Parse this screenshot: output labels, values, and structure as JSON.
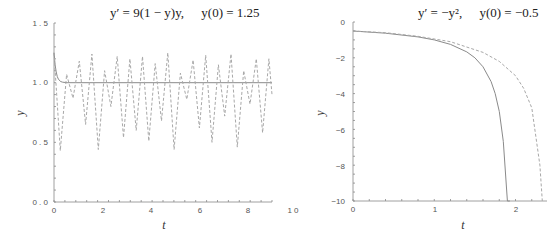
{
  "chart_data": [
    {
      "type": "line",
      "title": "y' = 9(1 − y)y,    y(0) = 1.25",
      "xlabel": "t",
      "ylabel": "y",
      "xlim": [
        0,
        10
      ],
      "ylim": [
        0,
        1.5
      ],
      "xticks": [
        "0",
        "2",
        "4",
        "6",
        "8",
        "10"
      ],
      "yticks": [
        "0.0",
        "0.5",
        "1.0",
        "1.5"
      ],
      "grid": false,
      "series": [
        {
          "name": "exact solution",
          "style": "solid",
          "x": [
            0,
            0.05,
            0.1,
            0.15,
            0.2,
            0.3,
            0.4,
            0.6,
            10
          ],
          "y": [
            1.25,
            1.15,
            1.09,
            1.05,
            1.03,
            1.01,
            1.004,
            1.0,
            1.0
          ]
        },
        {
          "name": "numerical (large step)",
          "style": "dashed",
          "x": [
            0,
            0.29,
            0.58,
            0.87,
            1.16,
            1.45,
            1.74,
            2.03,
            2.32,
            2.61,
            2.9,
            3.19,
            3.48,
            3.77,
            4.06,
            4.35,
            4.64,
            4.93,
            5.22,
            5.51,
            5.8,
            6.09,
            6.38,
            6.67,
            6.96,
            7.25,
            7.54,
            7.83,
            8.12,
            8.41,
            8.7,
            8.99,
            9.28,
            9.57,
            9.86,
            10
          ],
          "y": [
            1.25,
            0.43,
            1.07,
            0.87,
            1.18,
            0.65,
            1.24,
            0.44,
            1.1,
            0.8,
            1.22,
            0.54,
            1.2,
            0.6,
            1.22,
            0.51,
            1.16,
            0.68,
            1.25,
            0.44,
            1.08,
            0.86,
            1.19,
            0.62,
            1.23,
            0.5,
            1.15,
            0.72,
            1.24,
            0.46,
            1.1,
            0.82,
            1.2,
            0.58,
            1.2,
            0.9
          ]
        }
      ]
    },
    {
      "type": "line",
      "title": "y' = −y²,    y(0) = −0.5",
      "xlabel": "t",
      "ylabel": "y",
      "xlim": [
        0,
        2.4
      ],
      "ylim": [
        -10,
        0
      ],
      "xticks": [
        "0",
        "1",
        "2"
      ],
      "yticks": [
        "0",
        "−2",
        "−4",
        "−6",
        "−8",
        "−10"
      ],
      "grid": false,
      "series": [
        {
          "name": "exact solution",
          "style": "solid",
          "x": [
            0,
            0.4,
            0.8,
            1.0,
            1.2,
            1.4,
            1.5,
            1.6,
            1.7,
            1.75,
            1.8,
            1.85,
            1.9,
            1.93
          ],
          "y": [
            -0.5,
            -0.625,
            -0.833,
            -1.0,
            -1.25,
            -1.67,
            -2.0,
            -2.5,
            -3.33,
            -4.0,
            -5.0,
            -6.67,
            -10.0,
            -10.0
          ]
        },
        {
          "name": "numerical approximation",
          "style": "dashed",
          "x": [
            0,
            0.4,
            0.8,
            1.2,
            1.6,
            1.8,
            2.0,
            2.1,
            2.2,
            2.3,
            2.33
          ],
          "y": [
            -0.5,
            -0.6,
            -0.8,
            -1.1,
            -1.7,
            -2.2,
            -3.0,
            -3.7,
            -4.8,
            -8.0,
            -10.0
          ]
        }
      ]
    }
  ],
  "charts": {
    "left": {
      "title_lhs": "y′ = 9(1 − y)y,",
      "title_rhs": "y(0) = 1.25",
      "xlabel": "t",
      "ylabel": "y",
      "yticks": [
        "1 . 5",
        "1 . 0",
        "0 . 5",
        "0 . 0"
      ],
      "xticks": [
        "0",
        "2",
        "4",
        "6",
        "8",
        "1 0"
      ]
    },
    "right": {
      "title_lhs": "y′ = −y²,",
      "title_rhs": "y(0) = −0.5",
      "xlabel": "t",
      "ylabel": "y",
      "yticks": [
        "0",
        "−2",
        "−4",
        "−6",
        "−8",
        "−10"
      ],
      "xticks": [
        "0",
        "1",
        "2"
      ]
    },
    "colors": {
      "solid": "#8a8a8a",
      "dashed": "#a8a8a8",
      "axis": "#888888"
    }
  }
}
